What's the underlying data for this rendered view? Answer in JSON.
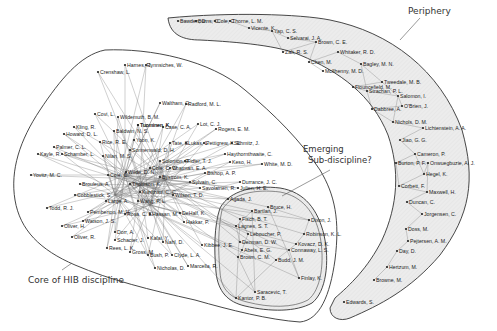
{
  "diagram": {
    "type": "co-author network with region annotations",
    "regions": [
      {
        "id": "core",
        "label": "Core of HIB  discipline",
        "fill": "#ffffff"
      },
      {
        "id": "emerging",
        "label_line1": "Emerging",
        "label_line2": "Sub-discipline?",
        "fill": "#ebebeb"
      },
      {
        "id": "periphery",
        "label": "Periphery",
        "fill": "#ebebeb"
      }
    ],
    "colors": {
      "outline": "#333333",
      "edge": "#777777",
      "shaded": "#ebebeb",
      "node": "#222222"
    },
    "core_nodes": [
      {
        "label": "Harnes, R.",
        "x": 125,
        "y": 65
      },
      {
        "label": "Jynnsiches, W.",
        "x": 146,
        "y": 65
      },
      {
        "label": "Crenshaw, L.",
        "x": 98,
        "y": 72
      },
      {
        "label": "Waltham, G.",
        "x": 160,
        "y": 103
      },
      {
        "label": "Radford, M. L.",
        "x": 186,
        "y": 104
      },
      {
        "label": "Covi, L.",
        "x": 95,
        "y": 114
      },
      {
        "label": "Wildemuth, B. M.",
        "x": 118,
        "y": 117
      },
      {
        "label": "Tuominen, K.",
        "x": 138,
        "y": 125
      },
      {
        "label": "Tuominen, K.",
        "x": 138,
        "y": 125
      },
      {
        "label": "Case, C. A.",
        "x": 163,
        "y": 127
      },
      {
        "label": "Lot, C. J.",
        "x": 198,
        "y": 124
      },
      {
        "label": "Rogers, E. M.",
        "x": 216,
        "y": 129
      },
      {
        "label": "Kling, R.",
        "x": 74,
        "y": 127
      },
      {
        "label": "Baldwin, N. S.",
        "x": 114,
        "y": 131
      },
      {
        "label": "Howard, D. L.",
        "x": 64,
        "y": 134
      },
      {
        "label": "Yoon, K.",
        "x": 134,
        "y": 140
      },
      {
        "label": "Rice, R. E.",
        "x": 100,
        "y": 142
      },
      {
        "label": "Tate, S.",
        "x": 170,
        "y": 143
      },
      {
        "label": "Lukas, L.",
        "x": 186,
        "y": 143
      },
      {
        "label": "Pettigrew, K. E.",
        "x": 204,
        "y": 143
      },
      {
        "label": "Schmitz, J.",
        "x": 232,
        "y": 143
      },
      {
        "label": "Palmer, C. L.",
        "x": 54,
        "y": 147
      },
      {
        "label": "Sonnenwald, D. H.",
        "x": 130,
        "y": 150
      },
      {
        "label": "Haythornthwaite, C.",
        "x": 225,
        "y": 154
      },
      {
        "label": "Kayle, R.",
        "x": 38,
        "y": 154
      },
      {
        "label": "Schamber, L.",
        "x": 62,
        "y": 154
      },
      {
        "label": "Nilan, M. S.",
        "x": 103,
        "y": 156
      },
      {
        "label": "Solomon, P.",
        "x": 160,
        "y": 161
      },
      {
        "label": "Fidler, T. J.",
        "x": 185,
        "y": 161
      },
      {
        "label": "Keso, H.",
        "x": 230,
        "y": 162
      },
      {
        "label": "White, M. D.",
        "x": 262,
        "y": 164
      },
      {
        "label": "Cole, C. W.",
        "x": 150,
        "y": 168
      },
      {
        "label": "Chatman, E. A.",
        "x": 170,
        "y": 168
      },
      {
        "label": "Wilde, D. N.",
        "x": 126,
        "y": 172
      },
      {
        "label": "Bishop, A. P.",
        "x": 205,
        "y": 173
      },
      {
        "label": "Yovitz, M. C.",
        "x": 31,
        "y": 175
      },
      {
        "label": "Cole, C.",
        "x": 108,
        "y": 175
      },
      {
        "label": "Bystrom, K.",
        "x": 160,
        "y": 177
      },
      {
        "label": "Sylvain, C.",
        "x": 190,
        "y": 182
      },
      {
        "label": "Durrance, J. C.",
        "x": 240,
        "y": 182
      },
      {
        "label": "Julien, H. E.",
        "x": 238,
        "y": 188
      },
      {
        "label": "Brouleus, A.",
        "x": 80,
        "y": 184
      },
      {
        "label": "Thomson, K.",
        "x": 130,
        "y": 184
      },
      {
        "label": "Savolainen, R.",
        "x": 200,
        "y": 188
      },
      {
        "label": "Kuhlthau, C. C.",
        "x": 140,
        "y": 192
      },
      {
        "label": "Wilson, T. D.",
        "x": 173,
        "y": 195
      },
      {
        "label": "Agada, J.",
        "x": 228,
        "y": 199
      },
      {
        "label": "Cobblestick, S.",
        "x": 75,
        "y": 195
      },
      {
        "label": "Large, A.",
        "x": 106,
        "y": 201
      },
      {
        "label": "Wang, P. L.",
        "x": 138,
        "y": 201
      },
      {
        "label": "Todd, R. J.",
        "x": 47,
        "y": 208
      },
      {
        "label": "Pemberton, M. H.",
        "x": 88,
        "y": 212
      },
      {
        "label": "Rosa, C. E.",
        "x": 125,
        "y": 214
      },
      {
        "label": "Hassan, M.",
        "x": 150,
        "y": 214
      },
      {
        "label": "DeHalf, K.",
        "x": 180,
        "y": 213
      },
      {
        "label": "Hakkar, P.",
        "x": 184,
        "y": 222
      },
      {
        "label": "Watson, J. S.",
        "x": 83,
        "y": 221
      },
      {
        "label": "Oliver, H.",
        "x": 62,
        "y": 226
      },
      {
        "label": "Dorr, A.",
        "x": 115,
        "y": 232
      },
      {
        "label": "Oliver, R.",
        "x": 72,
        "y": 237
      },
      {
        "label": "Schacter, J.",
        "x": 115,
        "y": 240
      },
      {
        "label": "Kafai, Y.",
        "x": 148,
        "y": 238
      },
      {
        "label": "Nahl, D.",
        "x": 163,
        "y": 242
      },
      {
        "label": "Rees, L. K.",
        "x": 107,
        "y": 248
      },
      {
        "label": "Gross, M.",
        "x": 130,
        "y": 252
      },
      {
        "label": "Bush, P.",
        "x": 148,
        "y": 255
      },
      {
        "label": "Clyde, L. A.",
        "x": 172,
        "y": 255
      },
      {
        "label": "Kibbee, J. E.",
        "x": 202,
        "y": 245
      },
      {
        "label": "Nicholas, D.",
        "x": 155,
        "y": 268
      },
      {
        "label": "Marcella, R.",
        "x": 188,
        "y": 266
      }
    ],
    "emerging_nodes": [
      {
        "label": "Bruce, H.",
        "x": 268,
        "y": 207
      },
      {
        "label": "Bartlan, J.",
        "x": 252,
        "y": 211
      },
      {
        "label": "Fisch, B. T.",
        "x": 240,
        "y": 219
      },
      {
        "label": "Dixon, J.",
        "x": 309,
        "y": 220
      },
      {
        "label": "Lagnes, S. T.",
        "x": 236,
        "y": 226
      },
      {
        "label": "Leboucher, P.",
        "x": 248,
        "y": 234
      },
      {
        "label": "Robinson, K. L.",
        "x": 304,
        "y": 234
      },
      {
        "label": "Denman, D. W.",
        "x": 240,
        "y": 242
      },
      {
        "label": "Abels, E. G.",
        "x": 242,
        "y": 250
      },
      {
        "label": "Kovacz, D. K.",
        "x": 296,
        "y": 244
      },
      {
        "label": "Connaway, L. S.",
        "x": 289,
        "y": 250
      },
      {
        "label": "Brown, C. M.",
        "x": 238,
        "y": 257
      },
      {
        "label": "Budd, J. M.",
        "x": 276,
        "y": 260
      },
      {
        "label": "Finlay, K.",
        "x": 299,
        "y": 278
      },
      {
        "label": "Saracevic, T.",
        "x": 255,
        "y": 292
      },
      {
        "label": "Kantor, P. B.",
        "x": 236,
        "y": 298
      }
    ],
    "periphery_nodes": [
      {
        "label": "Bawden, D.",
        "x": 178,
        "y": 21
      },
      {
        "label": "Burns, C.",
        "x": 196,
        "y": 21
      },
      {
        "label": "Cole, C.",
        "x": 215,
        "y": 21
      },
      {
        "label": "Thorne, L. M.",
        "x": 230,
        "y": 21
      },
      {
        "label": "Vicente, K.",
        "x": 249,
        "y": 28
      },
      {
        "label": "Yap, C. S.",
        "x": 272,
        "y": 31
      },
      {
        "label": "Selvarai, J. A.",
        "x": 288,
        "y": 38
      },
      {
        "label": "Brown, C. E.",
        "x": 316,
        "y": 42
      },
      {
        "label": "Zalt, R. S.",
        "x": 283,
        "y": 52
      },
      {
        "label": "Whitaker, R. D.",
        "x": 338,
        "y": 52
      },
      {
        "label": "Chen, M.",
        "x": 309,
        "y": 62
      },
      {
        "label": "McIlhenny, M. D.",
        "x": 323,
        "y": 71
      },
      {
        "label": "Bagley, M. N.",
        "x": 361,
        "y": 64
      },
      {
        "label": "Tweedale, M. B.",
        "x": 382,
        "y": 82
      },
      {
        "label": "Flouncefield, M.",
        "x": 353,
        "y": 87
      },
      {
        "label": "Strachan, P. L.",
        "x": 367,
        "y": 91
      },
      {
        "label": "Salomon, I.",
        "x": 398,
        "y": 96
      },
      {
        "label": "O'Brien, J.",
        "x": 402,
        "y": 106
      },
      {
        "label": "Dabbree, A.",
        "x": 372,
        "y": 109
      },
      {
        "label": "Nichols, D. M.",
        "x": 393,
        "y": 122
      },
      {
        "label": "Lichtenstein, A. A.",
        "x": 423,
        "y": 128
      },
      {
        "label": "Jiao, G. G.",
        "x": 400,
        "y": 140
      },
      {
        "label": "Cameron, P.",
        "x": 415,
        "y": 154
      },
      {
        "label": "Burton, P. F.",
        "x": 396,
        "y": 163
      },
      {
        "label": "Onwuegbuzie, A. J.",
        "x": 428,
        "y": 163
      },
      {
        "label": "Hegel, K.",
        "x": 424,
        "y": 174
      },
      {
        "label": "Corbett, F.",
        "x": 399,
        "y": 186
      },
      {
        "label": "Maxwell, H.",
        "x": 427,
        "y": 192
      },
      {
        "label": "Duncan, C.",
        "x": 407,
        "y": 202
      },
      {
        "label": "Jorgensen, C.",
        "x": 422,
        "y": 214
      },
      {
        "label": "Doss, M.",
        "x": 406,
        "y": 229
      },
      {
        "label": "Pejtersen, A. M.",
        "x": 408,
        "y": 241
      },
      {
        "label": "Day, D.",
        "x": 397,
        "y": 251
      },
      {
        "label": "Hertzum, M.",
        "x": 387,
        "y": 267
      },
      {
        "label": "Browne, M.",
        "x": 374,
        "y": 280
      },
      {
        "label": "Edwards, S.",
        "x": 344,
        "y": 302
      }
    ]
  }
}
